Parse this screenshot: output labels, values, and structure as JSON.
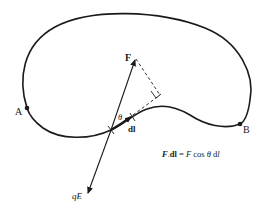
{
  "diagram": {
    "type": "line-integral-path",
    "points": {
      "start": {
        "label": "A"
      },
      "end": {
        "label": "B"
      }
    },
    "vectors": {
      "force": {
        "label": "F"
      },
      "field_force": {
        "label": "qE"
      },
      "displacement": {
        "label": "dl"
      }
    },
    "angle": {
      "label": "θ"
    },
    "formula": {
      "lhs_vector": "F",
      "dot": ".",
      "lhs_dl": "dl",
      "equals": " = ",
      "rhs_F": "F",
      "rhs_cos": " cos ",
      "rhs_theta": "θ",
      "rhs_d": " d",
      "rhs_l": "l"
    },
    "colors": {
      "stroke": "#1a1a1a",
      "background": "#ffffff"
    }
  }
}
